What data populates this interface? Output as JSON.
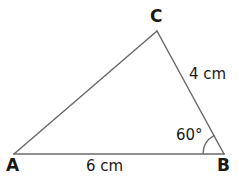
{
  "figure": {
    "type": "triangle-geometry-diagram",
    "background_color": "#ffffff",
    "stroke_color": "#6b6b6b",
    "text_color": "#1a1a1a",
    "stroke_width": 1.5,
    "canvas": {
      "width": 239,
      "height": 176
    }
  },
  "vertices": [
    {
      "name": "A",
      "label": "A",
      "x": 14,
      "y": 154
    },
    {
      "name": "B",
      "label": "B",
      "x": 224,
      "y": 154
    },
    {
      "name": "C",
      "label": "C",
      "x": 157,
      "y": 31
    }
  ],
  "sides": [
    {
      "name": "AB",
      "label": "6 cm",
      "value": 6,
      "unit": "cm",
      "from": "A",
      "to": "B"
    },
    {
      "name": "CB",
      "label": "4 cm",
      "value": 4,
      "unit": "cm",
      "from": "C",
      "to": "B"
    },
    {
      "name": "AC",
      "label": "",
      "value": null,
      "unit": "",
      "from": "A",
      "to": "C"
    }
  ],
  "angles": [
    {
      "name": "B",
      "label": "60°",
      "value": 60,
      "unit": "degrees",
      "at_vertex": "B",
      "arc_radius": 21
    }
  ],
  "geometry": {
    "path": "M 14 154 L 157 31 L 224 154 Z",
    "arc_path": "M 203 154 A 21 21 0 0 1 213.5 135.8"
  }
}
